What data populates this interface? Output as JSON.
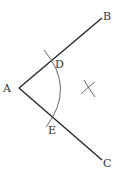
{
  "diagram": {
    "type": "geometry-construction",
    "colors": {
      "background": "#ffffff",
      "ray": "#222222",
      "arc": "#555555",
      "label": "#333333"
    },
    "points": {
      "A": {
        "label": "A",
        "x": 19,
        "y": 88,
        "label_x": 3,
        "label_y": 92
      },
      "B": {
        "label": "B",
        "x": 102,
        "y": 18,
        "label_x": 103,
        "label_y": 20
      },
      "C": {
        "label": "C",
        "x": 102,
        "y": 160,
        "label_x": 103,
        "label_y": 167
      },
      "D": {
        "label": "D",
        "x": 54,
        "y": 59,
        "label_x": 55,
        "label_y": 68
      },
      "E": {
        "label": "E",
        "x": 53,
        "y": 118,
        "label_x": 48,
        "label_y": 134
      }
    },
    "rays": [
      {
        "from": "A",
        "to": "B"
      },
      {
        "from": "A",
        "to": "C"
      }
    ],
    "arc": {
      "center": "A",
      "start": [
        44,
        50
      ],
      "mid": [
        64,
        88
      ],
      "end": [
        46,
        127
      ]
    },
    "cross_marks": {
      "position": [
        89,
        88
      ],
      "mark1": [
        [
          84,
          80
        ],
        [
          95,
          97
        ]
      ],
      "mark2": [
        [
          81,
          94
        ],
        [
          95,
          82
        ]
      ]
    }
  }
}
